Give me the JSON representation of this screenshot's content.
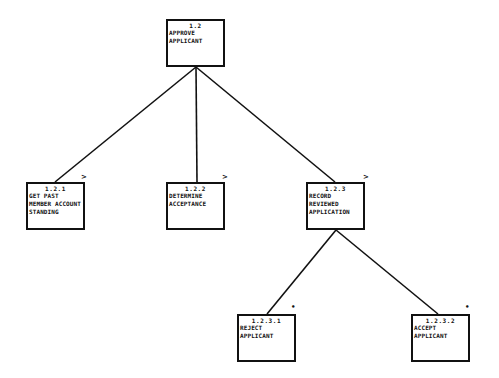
{
  "diagram": {
    "type": "hierarchy",
    "line_color": "#111111",
    "nodes": [
      {
        "id": "1.2",
        "number": "1.2",
        "lines": [
          "APPROVE",
          "APPLICANT"
        ],
        "marker": ""
      },
      {
        "id": "1.2.1",
        "number": "1.2.1",
        "lines": [
          "GET PAST",
          "MEMBER ACCOUNT",
          "STANDING"
        ],
        "marker": ">"
      },
      {
        "id": "1.2.2",
        "number": "1.2.2",
        "lines": [
          "DETERMINE",
          "ACCEPTANCE"
        ],
        "marker": ">"
      },
      {
        "id": "1.2.3",
        "number": "1.2.3",
        "lines": [
          "RECORD",
          "REVIEWED",
          "APPLICATION"
        ],
        "marker": ">"
      },
      {
        "id": "1.2.3.1",
        "number": "1.2.3.1",
        "lines": [
          "REJECT",
          "APPLICANT"
        ],
        "marker": "•"
      },
      {
        "id": "1.2.3.2",
        "number": "1.2.3.2",
        "lines": [
          "ACCEPT",
          "APPLICANT"
        ],
        "marker": "•"
      }
    ],
    "edges": [
      {
        "from": "1.2",
        "to": "1.2.1"
      },
      {
        "from": "1.2",
        "to": "1.2.2"
      },
      {
        "from": "1.2",
        "to": "1.2.3"
      },
      {
        "from": "1.2.3",
        "to": "1.2.3.1"
      },
      {
        "from": "1.2.3",
        "to": "1.2.3.2"
      }
    ]
  }
}
